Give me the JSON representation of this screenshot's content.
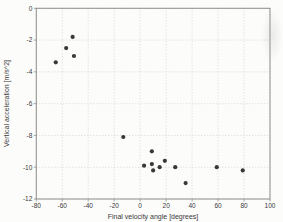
{
  "figure": {
    "background_color": "#fcfcfa",
    "frame_color": "#8f8f8f",
    "grid_color": "#c9c9c9",
    "marker_color": "#383838",
    "text_color": "#3a3a3a"
  },
  "chart_data": {
    "type": "scatter",
    "title": "",
    "xlabel": "Final velocity angle [degrees]",
    "ylabel": "Vertical acceleration [m/s^2]",
    "xlim": [
      -80,
      100
    ],
    "ylim": [
      -12,
      0
    ],
    "xticks": [
      -80,
      -60,
      -40,
      -20,
      0,
      20,
      40,
      60,
      80,
      100
    ],
    "yticks": [
      0,
      -2,
      -4,
      -6,
      -8,
      -10,
      -12
    ],
    "grid": true,
    "legend": null,
    "series": [
      {
        "name": "measurements",
        "points": [
          {
            "x": -65,
            "y": -3.4
          },
          {
            "x": -57,
            "y": -2.5
          },
          {
            "x": -52,
            "y": -1.8
          },
          {
            "x": -51,
            "y": -3.0
          },
          {
            "x": -13,
            "y": -8.1
          },
          {
            "x": 3,
            "y": -9.9
          },
          {
            "x": 9,
            "y": -9.0
          },
          {
            "x": 9,
            "y": -9.8
          },
          {
            "x": 10,
            "y": -10.2
          },
          {
            "x": 15,
            "y": -10.0
          },
          {
            "x": 19,
            "y": -9.6
          },
          {
            "x": 27,
            "y": -10.0
          },
          {
            "x": 35,
            "y": -11.0
          },
          {
            "x": 59,
            "y": -10.0
          },
          {
            "x": 79,
            "y": -10.2
          }
        ]
      }
    ]
  }
}
